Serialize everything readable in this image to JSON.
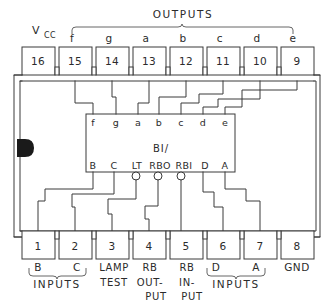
{
  "diagram": {
    "title_group_top": "OUTPUTS",
    "power_label": "V",
    "power_label_sub": "CC",
    "ground_label": "GND",
    "inner_center_label": "BI/",
    "group_inputs_left": "INPUTS",
    "group_inputs_right": "INPUTS",
    "colors": {
      "line": "#3a3a3a",
      "text": "#2b2b2b",
      "notch": "#1a1a1a",
      "background": "#ffffff"
    },
    "top_pins": [
      {
        "number": "16",
        "signal": "",
        "x": 47
      },
      {
        "number": "15",
        "signal": "f",
        "x": 84
      },
      {
        "number": "14",
        "signal": "g",
        "x": 119
      },
      {
        "number": "13",
        "signal": "a",
        "x": 154
      },
      {
        "number": "12",
        "signal": "b",
        "x": 189
      },
      {
        "number": "11",
        "signal": "c",
        "x": 224
      },
      {
        "number": "10",
        "signal": "d",
        "x": 259
      },
      {
        "number": "9",
        "signal": "e",
        "x": 294
      }
    ],
    "bottom_pins": [
      {
        "number": "1",
        "signal": "B",
        "function": "",
        "x": 47
      },
      {
        "number": "2",
        "signal": "C",
        "function": "",
        "x": 84
      },
      {
        "number": "3",
        "signal": "LAMP",
        "function": "TEST",
        "x": 119
      },
      {
        "number": "4",
        "signal": "RB",
        "function": "OUT-",
        "function2": "PUT",
        "x": 154
      },
      {
        "number": "5",
        "signal": "RB",
        "function": "IN-",
        "function2": "PUT",
        "x": 189
      },
      {
        "number": "6",
        "signal": "D",
        "function": "",
        "x": 224
      },
      {
        "number": "7",
        "signal": "A",
        "function": "",
        "x": 259
      },
      {
        "number": "8",
        "signal": "GND",
        "function": "",
        "x": 294
      }
    ],
    "inner_top_labels": [
      {
        "label": "f",
        "x": 93
      },
      {
        "label": "g",
        "x": 117
      },
      {
        "label": "a",
        "x": 140
      },
      {
        "label": "b",
        "x": 160
      },
      {
        "label": "c",
        "x": 181
      },
      {
        "label": "d",
        "x": 202
      },
      {
        "label": "e",
        "x": 224
      }
    ],
    "inner_bottom_labels": [
      {
        "label": "B",
        "x": 93,
        "bubble": false
      },
      {
        "label": "C",
        "x": 114,
        "bubble": false
      },
      {
        "label": "LT",
        "x": 137,
        "bubble": true
      },
      {
        "label": "RBO",
        "x": 159,
        "bubble": true
      },
      {
        "label": "RBI",
        "x": 181,
        "bubble": true
      },
      {
        "label": "D",
        "x": 203,
        "bubble": false
      },
      {
        "label": "A",
        "x": 224,
        "bubble": false
      }
    ]
  }
}
